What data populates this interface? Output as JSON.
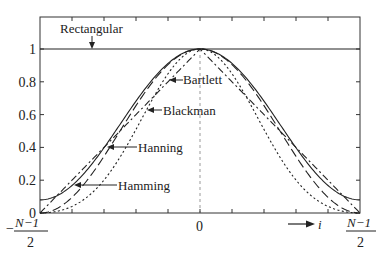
{
  "chart_data": {
    "type": "line",
    "title": "",
    "xlabel": "i",
    "ylabel": "",
    "xlim": [
      -1,
      1
    ],
    "ylim": [
      0,
      1.2
    ],
    "x_tick_labels": {
      "left": {
        "sign": "−",
        "numerator": "N−1",
        "denominator": "2"
      },
      "center": "0",
      "right": {
        "numerator": "N−1",
        "denominator": "2"
      }
    },
    "y_ticks": [
      0,
      0.2,
      0.4,
      0.6,
      0.8,
      1
    ],
    "y_tick_labels": [
      "0",
      "0.2",
      "0.4",
      "0.6",
      "0.8",
      "1"
    ],
    "x_axis_arrow_label": "i",
    "grid": false,
    "legend": "inline annotations with arrows",
    "series": [
      {
        "name": "Rectangular",
        "style": "solid",
        "formula": "w = 1",
        "x": [
          -1,
          -0.5,
          0,
          0.5,
          1
        ],
        "values": [
          1,
          1,
          1,
          1,
          1
        ]
      },
      {
        "name": "Bartlett",
        "style": "dash-dot",
        "formula": "w = 1 - |x|",
        "x": [
          -1,
          -0.5,
          0,
          0.5,
          1
        ],
        "values": [
          0,
          0.5,
          1,
          0.5,
          0
        ]
      },
      {
        "name": "Hanning",
        "style": "long-dash",
        "formula": "w = 0.5 + 0.5 cos(pi x)",
        "x": [
          -1,
          -0.75,
          -0.5,
          -0.25,
          0,
          0.25,
          0.5,
          0.75,
          1
        ],
        "values": [
          0,
          0.146,
          0.5,
          0.854,
          1,
          0.854,
          0.5,
          0.146,
          0
        ]
      },
      {
        "name": "Hamming",
        "style": "solid",
        "formula": "w = 0.54 + 0.46 cos(pi x)",
        "x": [
          -1,
          -0.75,
          -0.5,
          -0.25,
          0,
          0.25,
          0.5,
          0.75,
          1
        ],
        "values": [
          0.08,
          0.215,
          0.54,
          0.865,
          1,
          0.865,
          0.54,
          0.215,
          0.08
        ]
      },
      {
        "name": "Blackman",
        "style": "dotted",
        "formula": "w = 0.42 + 0.5 cos(pi x) + 0.08 cos(2 pi x)",
        "x": [
          -1,
          -0.75,
          -0.5,
          -0.25,
          0,
          0.25,
          0.5,
          0.75,
          1
        ],
        "values": [
          0,
          0.066,
          0.34,
          0.774,
          1,
          0.774,
          0.34,
          0.066,
          0
        ]
      }
    ],
    "annotations": [
      {
        "text": "Rectangular",
        "target": "Rectangular"
      },
      {
        "text": "Bartlett",
        "target": "Bartlett"
      },
      {
        "text": "Blackman",
        "target": "Blackman"
      },
      {
        "text": "Hanning",
        "target": "Hanning"
      },
      {
        "text": "Hamming",
        "target": "Hamming"
      }
    ]
  },
  "labels": {
    "rectangular": "Rectangular",
    "bartlett": "Bartlett",
    "blackman": "Blackman",
    "hanning": "Hanning",
    "hamming": "Hamming",
    "x_center": "0",
    "x_arrow": "i",
    "minus": "−",
    "frac_num": "N−1",
    "frac_den": "2"
  },
  "colors": {
    "axis": "#333333",
    "curve": "#222222",
    "center_line": "#999999"
  }
}
